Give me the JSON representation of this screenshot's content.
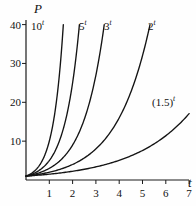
{
  "chart_data": {
    "type": "line",
    "title": "",
    "xlabel": "t",
    "ylabel": "P",
    "xlim": [
      0,
      7.6
    ],
    "ylim": [
      0,
      42
    ],
    "grid": false,
    "legend": "inline-curve-labels",
    "xticks": [
      1,
      2,
      3,
      4,
      5,
      6,
      7
    ],
    "xtick_labels": [
      "1",
      "2",
      "3",
      "4",
      "5",
      "6",
      "7"
    ],
    "yticks": [
      10,
      20,
      30,
      40
    ],
    "ytick_labels": [
      "10",
      "20",
      "30",
      "40"
    ],
    "series": [
      {
        "name": "10^t",
        "label_base": "10",
        "label_exp": "t",
        "base": 10,
        "t_end": 1.602,
        "p_end": 40,
        "label_x": 31,
        "label_y": 21,
        "points_t": [
          0,
          0.2,
          0.4,
          0.6,
          0.8,
          1.0,
          1.2,
          1.4,
          1.602
        ],
        "points_p": [
          1,
          1.58,
          2.51,
          3.98,
          6.31,
          10,
          15.85,
          25.12,
          40
        ]
      },
      {
        "name": "5^t",
        "label_base": "5",
        "label_exp": "t",
        "base": 5,
        "t_end": 2.292,
        "p_end": 40,
        "label_x": 79,
        "label_y": 21,
        "points_t": [
          0,
          0.3,
          0.6,
          0.9,
          1.2,
          1.5,
          1.8,
          2.1,
          2.292
        ],
        "points_p": [
          1,
          1.62,
          2.63,
          4.26,
          6.9,
          11.18,
          18.12,
          29.36,
          40
        ]
      },
      {
        "name": "3^t",
        "label_base": "3",
        "label_exp": "t",
        "base": 3,
        "t_end": 3.358,
        "p_end": 40,
        "label_x": 104,
        "label_y": 21,
        "points_t": [
          0,
          0.5,
          1.0,
          1.5,
          2.0,
          2.5,
          3.0,
          3.358
        ],
        "points_p": [
          1,
          1.73,
          3,
          5.2,
          9,
          15.59,
          27,
          40
        ]
      },
      {
        "name": "2^t",
        "label_base": "2",
        "label_exp": "t",
        "base": 2,
        "t_end": 5.322,
        "p_end": 40,
        "label_x": 148,
        "label_y": 21,
        "points_t": [
          0,
          0.8,
          1.6,
          2.4,
          3.2,
          4.0,
          4.8,
          5.322
        ],
        "points_p": [
          1,
          1.74,
          3.03,
          5.28,
          9.19,
          16,
          27.86,
          40
        ]
      },
      {
        "name": "(1.5)^t",
        "label_base": "(1.5)",
        "label_exp": "t",
        "base": 1.5,
        "t_end": 7.0,
        "p_end": 17.09,
        "label_x": 152,
        "label_y": 97,
        "points_t": [
          0,
          1,
          2,
          3,
          4,
          5,
          6,
          7
        ],
        "points_p": [
          1,
          1.5,
          2.25,
          3.375,
          5.06,
          7.59,
          11.39,
          17.09
        ]
      }
    ]
  },
  "axes": {
    "y_axis_name": "P",
    "x_axis_name": "t",
    "line_color": "#1a1a1a"
  }
}
